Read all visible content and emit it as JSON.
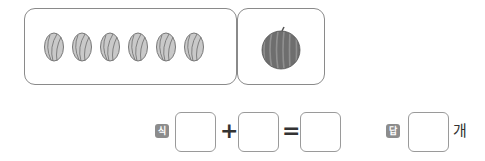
{
  "groups": {
    "left": {
      "item": "watermelon-small",
      "count": 6
    },
    "right": {
      "item": "watermelon-large",
      "count": 1
    }
  },
  "equation": {
    "label": "식",
    "operator_plus": "+",
    "operator_equals": "=",
    "boxes": [
      "",
      "",
      ""
    ]
  },
  "answer": {
    "label": "답",
    "value": "",
    "unit": "개"
  },
  "colors": {
    "border": "#8a8a8a",
    "badge": "#8c8c8c",
    "small_melon": "#c9c9c9",
    "big_melon": "#6e6e6e"
  }
}
